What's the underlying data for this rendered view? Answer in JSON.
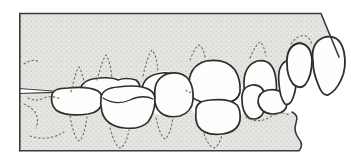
{
  "figure": {
    "alt": "Line drawing of upper and lower teeth in occlusion, lateral view",
    "jaw_upper": "maxilla",
    "jaw_lower": "mandible"
  },
  "colors": {
    "background": "#ffffff",
    "jaw_fill": "#e5e4e1",
    "stipple_dot": "#b5b4b0",
    "outline": "#2d2d2d",
    "frame": "#3a3a3a",
    "tooth_fill": "#fdfdfc",
    "dotted_line": "#6f6e6a"
  }
}
